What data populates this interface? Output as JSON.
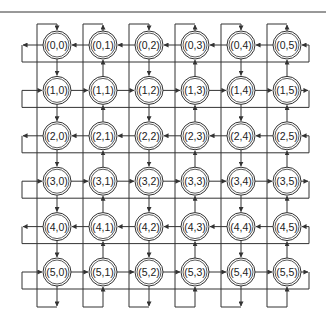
{
  "diagram": {
    "type": "torus-mesh",
    "rows": 6,
    "cols": 6,
    "origin": {
      "x": 57,
      "y": 45
    },
    "spacing": {
      "x": 46,
      "y": 45.4
    },
    "node_radius": 14,
    "colors": {
      "line": "#333333",
      "text": "#222222",
      "background": "#ffffff"
    },
    "top_rule_y": 12,
    "row_flow": [
      "left",
      "right",
      "left",
      "right",
      "left",
      "right"
    ],
    "col_flow": [
      "down",
      "up",
      "down",
      "up",
      "down",
      "up"
    ],
    "nodes": [
      [
        "(0,0)",
        "(0,1)",
        "(0,2)",
        "(0,3)",
        "(0,4)",
        "(0,5)"
      ],
      [
        "(1,0)",
        "(1,1)",
        "(1,2)",
        "(1,3)",
        "(1,4)",
        "(1,5)"
      ],
      [
        "(2,0)",
        "(2,1)",
        "(2,2)",
        "(2,3)",
        "(2,4)",
        "(2,5)"
      ],
      [
        "(3,0)",
        "(3,1)",
        "(3,2)",
        "(3,3)",
        "(3,4)",
        "(3,5)"
      ],
      [
        "(4,0)",
        "(4,1)",
        "(4,2)",
        "(4,3)",
        "(4,4)",
        "(4,5)"
      ],
      [
        "(5,0)",
        "(5,1)",
        "(5,2)",
        "(5,3)",
        "(5,4)",
        "(5,5)"
      ]
    ]
  }
}
